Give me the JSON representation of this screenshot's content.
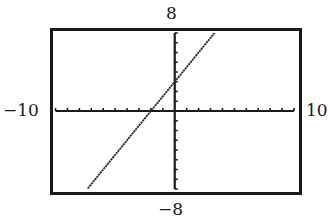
{
  "window": {
    "xmin": -10,
    "xmax": 10,
    "ymin": -8,
    "ymax": 8,
    "xscl": 1,
    "yscl": 1
  },
  "labels": {
    "xmin": "−10",
    "xmax": "10",
    "ymin": "−8",
    "ymax": "8"
  },
  "colors": {
    "frame": "#1a1a1a",
    "axes": "#1a1a1a",
    "line": "#2a2a2a",
    "background": "#ffffff"
  },
  "chart_data": {
    "type": "line",
    "title": "",
    "xlabel": "",
    "ylabel": "",
    "xlim": [
      -10,
      10
    ],
    "ylim": [
      -8,
      8
    ],
    "grid": false,
    "legend": null,
    "tick_spacing": {
      "x": 1,
      "y": 1
    },
    "x_tick_count_each_side": 10,
    "y_tick_count_each_side": 8,
    "series": [
      {
        "name": "y = 1.5x + 3",
        "equation": "y = 1.5x + 3",
        "slope": 1.5,
        "intercept": 3,
        "x": [
          -7.3,
          -6,
          -4,
          -2,
          0,
          2,
          3.33
        ],
        "y": [
          -7.95,
          -6,
          -3,
          0,
          3,
          6,
          8
        ]
      }
    ],
    "annotations": [
      {
        "text": "8",
        "position": "top (ymax)"
      },
      {
        "text": "−8",
        "position": "bottom (ymin)"
      },
      {
        "text": "−10",
        "position": "left (xmin)"
      },
      {
        "text": "10",
        "position": "right (xmax)"
      }
    ],
    "x_intercept": -2,
    "y_intercept": 3
  }
}
